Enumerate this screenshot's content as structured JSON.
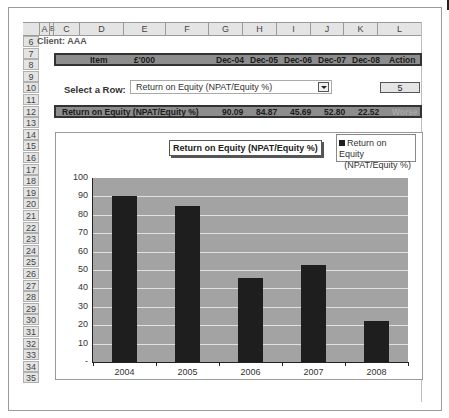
{
  "spreadsheet": {
    "columns": [
      "A",
      "B",
      "C",
      "D",
      "E",
      "F",
      "G",
      "H",
      "I",
      "J",
      "K",
      "L"
    ],
    "rows": [
      "6",
      "7",
      "8",
      "9",
      "10",
      "11",
      "12",
      "13",
      "14",
      "15",
      "16",
      "17",
      "18",
      "19",
      "20",
      "21",
      "22",
      "23",
      "24",
      "25",
      "26",
      "27",
      "28",
      "29",
      "30",
      "31",
      "32",
      "33",
      "34",
      "35"
    ]
  },
  "client_label": "Client: AAA",
  "header_band": {
    "item": "Item",
    "unit": "£'000",
    "periods": [
      "Dec-04",
      "Dec-05",
      "Dec-06",
      "Dec-07",
      "Dec-08"
    ],
    "action": "Action"
  },
  "selector": {
    "label": "Select a Row:",
    "selected_value": "Return on Equity (NPAT/Equity %)",
    "row_number": "5"
  },
  "result_band": {
    "label": "Return on Equity (NPAT/Equity %)",
    "values": [
      "90.09",
      "84.87",
      "45.69",
      "52.80",
      "22.52"
    ],
    "action": "Worse"
  },
  "chart_data": {
    "type": "bar",
    "title": "Return on Equity (NPAT/Equity %)",
    "categories": [
      "2004",
      "2005",
      "2006",
      "2007",
      "2008"
    ],
    "series": [
      {
        "name": "Return on Equity (NPAT/Equity %)",
        "values": [
          90.09,
          84.87,
          45.69,
          52.8,
          22.52
        ],
        "color": "#1e1e1e"
      }
    ],
    "legend": {
      "line1": "Return on Equity",
      "line2": "(NPAT/Equity %)",
      "position": "top-right"
    },
    "xlabel": "",
    "ylabel": "",
    "ylim": [
      0,
      100
    ],
    "yticks": [
      "100",
      "90",
      "80",
      "70",
      "60",
      "50",
      "40",
      "30",
      "20",
      "10",
      "-"
    ],
    "grid": true,
    "plot_background": "#a3a3a3"
  }
}
